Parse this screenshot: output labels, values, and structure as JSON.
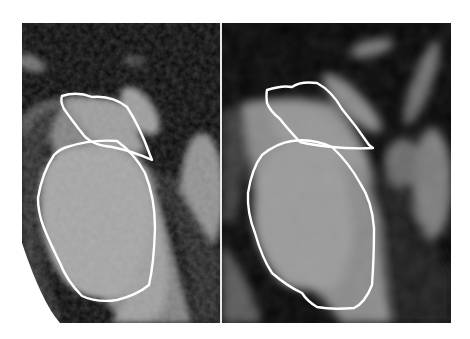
{
  "figure": {
    "panels": [
      {
        "id": "left",
        "description": "CT image with manual contours, noisier texture"
      },
      {
        "id": "right",
        "description": "CT image with manual contours, smoother texture"
      }
    ],
    "colors": {
      "background": "#ffffff",
      "contour": "#ffffff",
      "tissue_light": "#a8a8a8",
      "tissue_mid": "#8a8a8a",
      "dark": "#050505",
      "divider": "#e8e8e8"
    }
  }
}
